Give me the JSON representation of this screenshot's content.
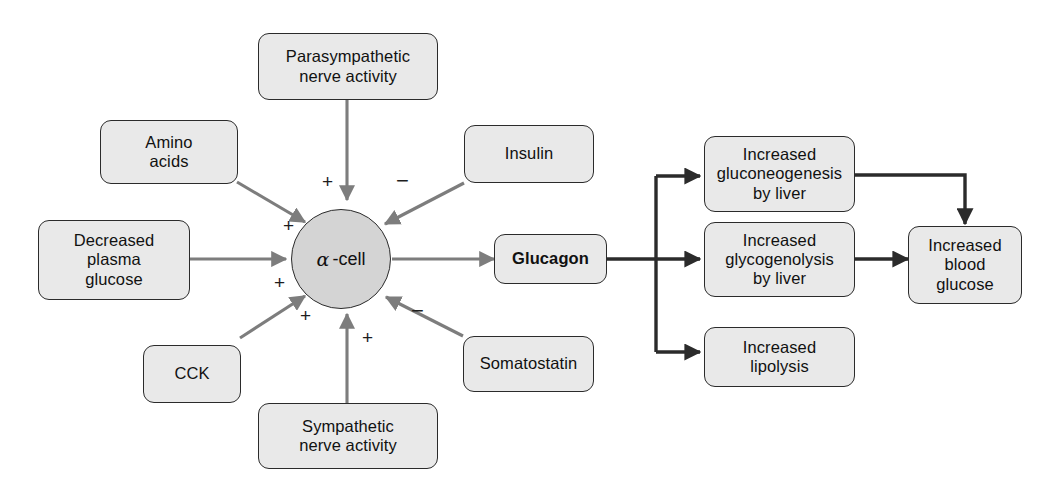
{
  "diagram": {
    "colors": {
      "box_fill": "#e9e9e9",
      "box_border": "#2b2b2b",
      "cell_fill": "#d4d4d4",
      "stimulus_arrow": "#7d7d7d",
      "effect_arrow": "#2b2b2b",
      "background": "#ffffff"
    },
    "cell": {
      "alpha_symbol": "α",
      "label": "-cell"
    },
    "stimuli": [
      {
        "id": "parasympathetic",
        "label": "Parasympathetic\nnerve activity",
        "sign": "+"
      },
      {
        "id": "amino-acids",
        "label": "Amino\nacids",
        "sign": "+"
      },
      {
        "id": "decreased-plasma-glucose",
        "label": "Decreased\nplasma\nglucose",
        "sign": "+"
      },
      {
        "id": "cck",
        "label": "CCK",
        "sign": "+"
      },
      {
        "id": "sympathetic",
        "label": "Sympathetic\nnerve activity",
        "sign": "+"
      },
      {
        "id": "insulin",
        "label": "Insulin",
        "sign": "−"
      },
      {
        "id": "somatostatin",
        "label": "Somatostatin",
        "sign": "−"
      }
    ],
    "hormone": {
      "id": "glucagon",
      "label": "Glucagon"
    },
    "effects": [
      {
        "id": "gluconeogenesis",
        "label": "Increased\ngluconeogenesis\nby liver"
      },
      {
        "id": "glycogenolysis",
        "label": "Increased\nglycogenolysis\nby liver"
      },
      {
        "id": "lipolysis",
        "label": "Increased\nlipolysis"
      }
    ],
    "outcome": {
      "id": "blood-glucose",
      "label": "Increased\nblood\nglucose"
    },
    "signs": {
      "plus": "+",
      "minus": "−"
    }
  }
}
